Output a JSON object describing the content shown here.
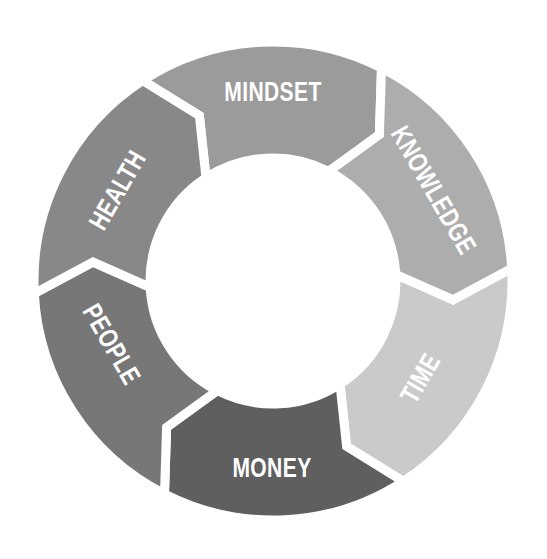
{
  "diagram": {
    "type": "cycle",
    "direction": "clockwise",
    "center": [
      273,
      281
    ],
    "outer_radius": 239,
    "inner_radius": 123,
    "tip_offset_deg": 9,
    "center_fill": "#ffffff",
    "label_color": "#ffffff",
    "segments": [
      {
        "label": "MINDSET",
        "start_deg": -123,
        "end_deg": -63,
        "color": "#9b9b9b",
        "label_x": 273,
        "label_y": 92,
        "label_rotate": 0
      },
      {
        "label": "KNOWLEDGE",
        "start_deg": -63,
        "end_deg": -3,
        "color": "#adadad",
        "label_x": 434,
        "label_y": 190,
        "label_rotate": 60
      },
      {
        "label": "TIME",
        "start_deg": -3,
        "end_deg": 57,
        "color": "#cacaca",
        "label_x": 420,
        "label_y": 378,
        "label_rotate": -60
      },
      {
        "label": "MONEY",
        "start_deg": 57,
        "end_deg": 117,
        "color": "#5f5f5f",
        "label_x": 272,
        "label_y": 468,
        "label_rotate": 0
      },
      {
        "label": "PEOPLE",
        "start_deg": 117,
        "end_deg": 177,
        "color": "#777777",
        "label_x": 112,
        "label_y": 344,
        "label_rotate": 60
      },
      {
        "label": "HEALTH",
        "start_deg": 177,
        "end_deg": 237,
        "color": "#888888",
        "label_x": 117,
        "label_y": 190,
        "label_rotate": -60
      }
    ]
  }
}
